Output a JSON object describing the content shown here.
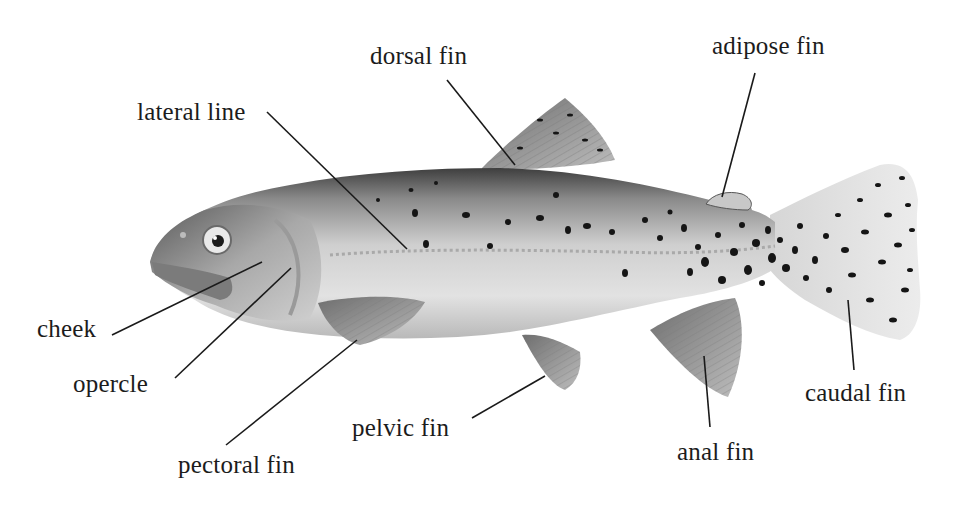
{
  "diagram": {
    "colors": {
      "background": "#ffffff",
      "label_text": "#1c1c1c",
      "leader_line": "#1a1a1a",
      "body_light": "#dcdcdc",
      "body_dark": "#4a4a4a",
      "spot": "#151515"
    },
    "labels": [
      {
        "id": "dorsal-fin",
        "text": "dorsal fin",
        "x": 370,
        "y": 42,
        "line": [
          447,
          80,
          515,
          165
        ]
      },
      {
        "id": "adipose-fin",
        "text": "adipose fin",
        "x": 712,
        "y": 32,
        "line": [
          755,
          73,
          722,
          197
        ]
      },
      {
        "id": "lateral-line",
        "text": "lateral line",
        "x": 137,
        "y": 98,
        "line": [
          267,
          112,
          407,
          249
        ]
      },
      {
        "id": "cheek",
        "text": "cheek",
        "x": 37,
        "y": 315,
        "line": [
          112,
          335,
          262,
          262
        ]
      },
      {
        "id": "opercle",
        "text": "opercle",
        "x": 73,
        "y": 370,
        "line": [
          175,
          378,
          291,
          268
        ]
      },
      {
        "id": "pectoral-fin",
        "text": "pectoral fin",
        "x": 178,
        "y": 451,
        "line": [
          226,
          445,
          357,
          340
        ]
      },
      {
        "id": "pelvic-fin",
        "text": "pelvic fin",
        "x": 352,
        "y": 414,
        "line": [
          472,
          418,
          545,
          376
        ]
      },
      {
        "id": "anal-fin",
        "text": "anal fin",
        "x": 677,
        "y": 438,
        "line": [
          710,
          427,
          704,
          356
        ]
      },
      {
        "id": "caudal-fin",
        "text": "caudal fin",
        "x": 805,
        "y": 379,
        "line": [
          854,
          370,
          848,
          300
        ]
      }
    ]
  }
}
